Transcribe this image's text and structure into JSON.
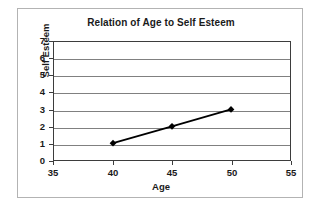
{
  "chart_data": {
    "type": "line",
    "title": "Relation of Age to Self Esteem",
    "xlabel": "Age",
    "ylabel": "Self Esteem",
    "x": [
      40,
      45,
      50
    ],
    "values": [
      1,
      2,
      3
    ],
    "series": [
      {
        "name": "Self Esteem",
        "x": [
          40,
          45,
          50
        ],
        "values": [
          1,
          2,
          3
        ],
        "marker": "diamond",
        "marker_color": "#000000",
        "line_color": "#000000"
      }
    ],
    "xlim": [
      35,
      55
    ],
    "ylim": [
      0,
      7
    ],
    "xticks": [
      35,
      40,
      45,
      50,
      55
    ],
    "yticks": [
      0,
      1,
      2,
      3,
      4,
      5,
      6,
      7
    ],
    "xtick_labels": [
      "35",
      "40",
      "45",
      "50",
      "55"
    ],
    "ytick_labels": [
      "0",
      "1",
      "2",
      "3",
      "4",
      "5",
      "6",
      "7"
    ],
    "grid": {
      "horizontal": true,
      "vertical": false,
      "color": "#808080"
    },
    "legend": {
      "visible": false,
      "position": "none"
    },
    "colors": {
      "plot_border": "#3d3d3d",
      "frame_border": "#b3b3b3",
      "background": "#ffffff",
      "text": "#1a1a1a"
    }
  }
}
